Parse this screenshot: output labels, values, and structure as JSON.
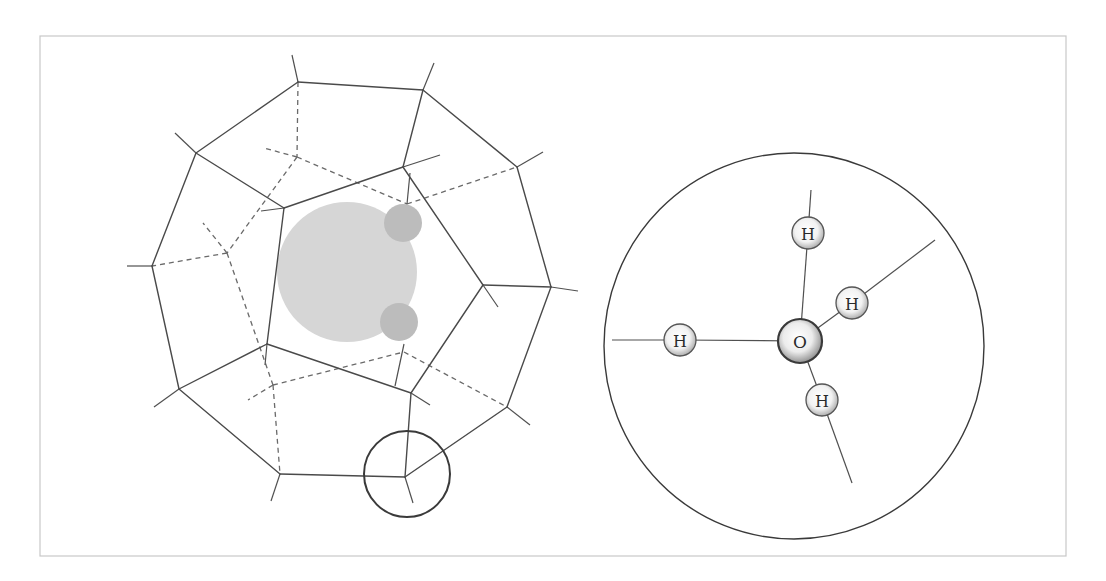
{
  "figure": {
    "frame": {
      "x": 40,
      "y": 36,
      "w": 1026,
      "h": 520
    },
    "colors": {
      "edge": "#4a4a4a",
      "hidden_edge": "#6a6a6a",
      "guest_large": "#d6d6d6",
      "guest_small": "#bcbcbc",
      "atom_edge": "#555555"
    },
    "cage": {
      "description": "Dodecahedral water cage (clathrate) with enclosed guest molecule",
      "outer_vertices": [
        {
          "id": "A",
          "x": 298,
          "y": 82,
          "stub": [
            292,
            55
          ]
        },
        {
          "id": "E",
          "x": 423,
          "y": 90,
          "stub": [
            434,
            63
          ]
        },
        {
          "id": "F",
          "x": 517,
          "y": 167,
          "stub": [
            543,
            152
          ]
        },
        {
          "id": "G",
          "x": 551,
          "y": 287,
          "stub": [
            578,
            291
          ]
        },
        {
          "id": "H",
          "x": 507,
          "y": 407,
          "stub": [
            530,
            425
          ]
        },
        {
          "id": "I",
          "x": 405,
          "y": 477,
          "stub": [
            413,
            503
          ]
        },
        {
          "id": "J",
          "x": 280,
          "y": 474,
          "stub": [
            271,
            501
          ]
        },
        {
          "id": "K",
          "x": 179,
          "y": 389,
          "stub": [
            154,
            407
          ]
        },
        {
          "id": "C",
          "x": 152,
          "y": 266,
          "stub": [
            127,
            266
          ]
        },
        {
          "id": "B",
          "x": 196,
          "y": 153,
          "stub": [
            175,
            133
          ]
        }
      ],
      "inner_vertices": [
        {
          "id": "D",
          "x": 284,
          "y": 208,
          "stub": [
            261,
            211
          ]
        },
        {
          "id": "L",
          "x": 403,
          "y": 167,
          "stub": [
            440,
            155
          ]
        },
        {
          "id": "M",
          "x": 483,
          "y": 285,
          "stub": [
            498,
            307
          ]
        },
        {
          "id": "N",
          "x": 411,
          "y": 393,
          "stub": [
            430,
            405
          ]
        },
        {
          "id": "O",
          "x": 267,
          "y": 344,
          "stub": [
            265,
            365
          ]
        }
      ],
      "spokes": [
        [
          "B",
          "D"
        ],
        [
          "E",
          "L"
        ],
        [
          "G",
          "M"
        ],
        [
          "I",
          "N"
        ],
        [
          "K",
          "O"
        ]
      ],
      "hidden_vertices": [
        {
          "id": "P",
          "x": 227,
          "y": 253
        },
        {
          "id": "Q",
          "x": 273,
          "y": 385
        },
        {
          "id": "R",
          "x": 297,
          "y": 157
        },
        {
          "id": "S",
          "x": 407,
          "y": 204
        },
        {
          "id": "T",
          "x": 404,
          "y": 352
        }
      ],
      "hidden_edges": [
        [
          [
            298,
            82
          ],
          [
            297,
            157
          ]
        ],
        [
          [
            297,
            157
          ],
          [
            264,
            148
          ]
        ],
        [
          [
            297,
            157
          ],
          [
            407,
            204
          ]
        ],
        [
          [
            407,
            204
          ],
          [
            517,
            167
          ]
        ],
        [
          [
            297,
            157
          ],
          [
            227,
            253
          ]
        ],
        [
          [
            227,
            253
          ],
          [
            152,
            266
          ]
        ],
        [
          [
            227,
            253
          ],
          [
            203,
            223
          ]
        ],
        [
          [
            227,
            253
          ],
          [
            273,
            385
          ]
        ],
        [
          [
            273,
            385
          ],
          [
            280,
            474
          ]
        ],
        [
          [
            273,
            385
          ],
          [
            248,
            400
          ]
        ],
        [
          [
            273,
            385
          ],
          [
            404,
            352
          ]
        ],
        [
          [
            404,
            352
          ],
          [
            507,
            407
          ]
        ]
      ],
      "hbond_segments": [
        [
          [
            410,
            173
          ],
          [
            407,
            204
          ]
        ],
        [
          [
            404,
            344
          ],
          [
            395,
            386
          ]
        ]
      ]
    },
    "guest": {
      "large": {
        "cx": 347,
        "cy": 272,
        "r": 70
      },
      "small": [
        {
          "cx": 403,
          "cy": 223,
          "r": 19
        },
        {
          "cx": 399,
          "cy": 322,
          "r": 19
        }
      ]
    },
    "magnifier": {
      "cx": 407,
      "cy": 474,
      "r": 43
    },
    "zoom_view": {
      "circle": {
        "cx": 794,
        "cy": 346,
        "rx": 190,
        "ry": 193
      },
      "oxygen": {
        "label": "O",
        "cx": 800,
        "cy": 341,
        "r": 22
      },
      "hydrogens": [
        {
          "label": "H",
          "cx": 680,
          "cy": 340,
          "r": 16,
          "bond_end": [
            612,
            340
          ]
        },
        {
          "label": "H",
          "cx": 808,
          "cy": 233,
          "r": 16,
          "bond_end": [
            811,
            190
          ]
        },
        {
          "label": "H",
          "cx": 852,
          "cy": 303,
          "r": 16,
          "bond_end": [
            935,
            240
          ]
        },
        {
          "label": "H",
          "cx": 822,
          "cy": 400,
          "r": 16,
          "bond_end": [
            852,
            483
          ]
        }
      ]
    }
  }
}
